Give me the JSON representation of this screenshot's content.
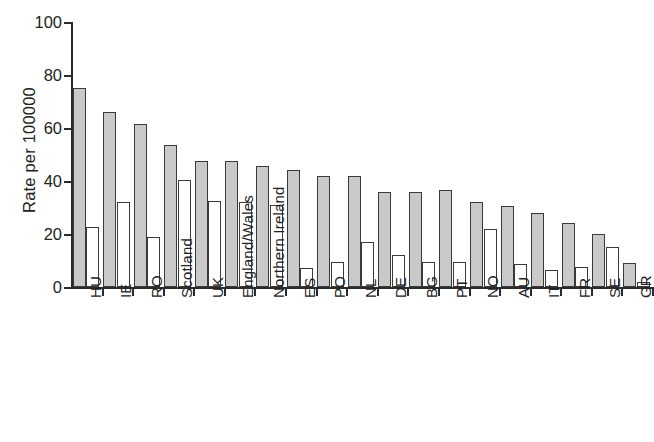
{
  "chart_data": {
    "type": "bar",
    "title": "",
    "subtitle": "",
    "xlabel": "",
    "ylabel": "Rate per 100000",
    "ylim": [
      0,
      100
    ],
    "yticks": [
      0,
      20,
      40,
      60,
      80,
      100
    ],
    "ytick_labels": [
      "0",
      "20",
      "40",
      "60",
      "80",
      "100"
    ],
    "grid": false,
    "legend": "none",
    "orientation": "vertical",
    "xtick_label_rotation": 90,
    "categories": [
      "HU",
      "IE",
      "RO",
      "Scotland",
      "UK",
      "England/Wales",
      "Northern Ireland",
      "ES",
      "PO",
      "NL",
      "DE",
      "BG",
      "PT",
      "NO",
      "AU",
      "IT",
      "FR",
      "SE",
      "GR"
    ],
    "series": [
      {
        "name": "gray-bars",
        "color": "#c9c9c9",
        "values": [
          75,
          66,
          61.5,
          53.5,
          47.5,
          47.5,
          45.5,
          44,
          42,
          42,
          36,
          36,
          36.5,
          32,
          30.5,
          28,
          24,
          20,
          9
        ]
      },
      {
        "name": "white-bars",
        "color": "#ffffff",
        "values": [
          22.5,
          32,
          19,
          40.5,
          32.5,
          32,
          31,
          7,
          9.5,
          17,
          12,
          9.5,
          9.5,
          22,
          8.5,
          6.5,
          7.5,
          15,
          2
        ]
      }
    ]
  }
}
